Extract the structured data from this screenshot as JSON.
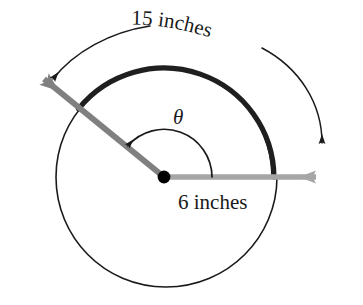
{
  "figure": {
    "type": "geometry-diagram",
    "background_color": "#ffffff",
    "canvas": {
      "width": 363,
      "height": 305
    }
  },
  "labels": {
    "arc_length": "15 inches",
    "radius": "6 inches",
    "angle": "θ"
  },
  "colors": {
    "outline": "#1a1a1a",
    "thick_arc": "#1a1a1a",
    "initial_ray": "#a6a6a6",
    "terminal_ray": "#808080",
    "vertex": "#000000",
    "dimension_arc": "#1a1a1a",
    "text": "#1a1a1a"
  },
  "geometry": {
    "center": {
      "x": 164,
      "y": 177
    },
    "circle_radius": 109,
    "thick_arc_radius": 110,
    "thick_arc_start_deg": 0,
    "thick_arc_end_deg": 141,
    "theta_arc_radius": 48,
    "dimension_arc_radius": 146,
    "terminal_ray_tip": {
      "x": 30,
      "y": 68
    },
    "initial_ray_tip": {
      "x": 332,
      "y": 177
    },
    "terminal_ray_angle_deg": 141,
    "initial_ray_angle_deg": 0
  },
  "elements": {
    "circle_name": "circle-outline",
    "thick_arc_name": "highlighted-arc",
    "initial_ray_name": "initial-side-ray",
    "terminal_ray_name": "terminal-side-ray",
    "vertex_name": "center-vertex-dot",
    "theta_arc_name": "central-angle-arc",
    "dimension_arc_name": "arc-length-dimension"
  }
}
